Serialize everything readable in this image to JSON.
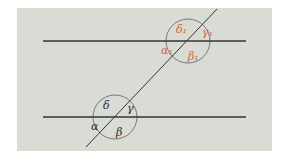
{
  "diagram": {
    "panel": {
      "x": 17,
      "y": 8,
      "width": 255,
      "height": 143,
      "fill": "#d9dcd5"
    },
    "colors": {
      "line": "#333333",
      "circle": "#6a6a6a",
      "label_black": "#2a2a2a",
      "label_red": "#d9603b"
    },
    "parallel_lines": [
      {
        "name": "upper-parallel-line",
        "x1": 43,
        "y1": 41,
        "x2": 246,
        "y2": 41
      },
      {
        "name": "lower-parallel-line",
        "x1": 43,
        "y1": 117,
        "x2": 246,
        "y2": 117
      }
    ],
    "transversal": {
      "x1": 86,
      "y1": 147,
      "x2": 217,
      "y2": 9
    },
    "intersections": [
      {
        "name": "upper-intersection",
        "cx": 188,
        "cy": 41,
        "r": 22
      },
      {
        "name": "lower-intersection",
        "cx": 115,
        "cy": 117,
        "r": 22
      }
    ],
    "labels": {
      "upper": {
        "delta": "δ₁",
        "gamma": "γ₁",
        "alpha": "α₁",
        "beta": "β₁"
      },
      "lower": {
        "delta": "δ",
        "gamma": "γ",
        "alpha": "α",
        "beta": "β"
      }
    }
  }
}
